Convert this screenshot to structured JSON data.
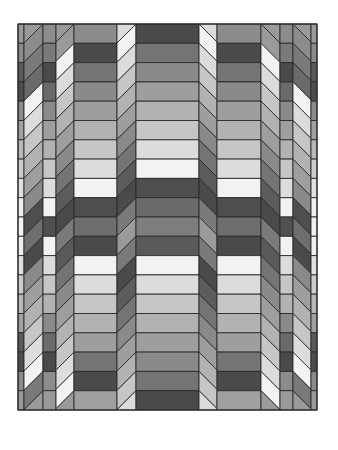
{
  "image": {
    "subject": "Quilt pattern",
    "description": "Grayscale pieced quilt with horizontal bands and slanted folded columns creating a 3D ribbon illusion"
  },
  "quilt": {
    "bounds": {
      "x": 18,
      "y": 24,
      "width": 299,
      "height": 386
    },
    "rows": 20,
    "border_color": "#2a2a2a",
    "palette": [
      "#4a4a4a",
      "#5c5c5c",
      "#747474",
      "#8a8a8a",
      "#9e9e9e",
      "#b2b2b2",
      "#c6c6c6",
      "#dcdcdc",
      "#f2f2f2"
    ],
    "columns": [
      {
        "name": "edge-left",
        "x0": 18,
        "x1": 24,
        "type": "flat",
        "colors": [
          "#9a9a9a",
          "#8a8a8a",
          "#5a5a5a",
          "#4e4e4e",
          "#8a8a8a",
          "#a0a0a0",
          "#b8b8b8",
          "#cccccc",
          "#e0e0e0",
          "#f0f0f0",
          "#f2f2f2",
          "#f0f0f0",
          "#e0e0e0",
          "#cccccc",
          "#b8b8b8",
          "#a0a0a0",
          "#5a5a5a",
          "#4e4e4e",
          "#8a8a8a",
          "#9a9a9a"
        ]
      },
      {
        "name": "slant-left-outer",
        "x0": 24,
        "x1": 43,
        "type": "slant",
        "dir": "down",
        "start": 2,
        "colors": [
          "#8c8c8c",
          "#7a7a7a",
          "#6a6a6a",
          "#f2f2f2",
          "#dcdcdc",
          "#c6c6c6",
          "#b2b2b2",
          "#9e9e9e",
          "#8a8a8a",
          "#4e4e4e",
          "#6e6e6e",
          "#4a4a4a",
          "#8a8a8a",
          "#9e9e9e",
          "#b2b2b2",
          "#c6c6c6",
          "#dcdcdc",
          "#f2f2f2",
          "#7a7a7a",
          "#9a9a9a"
        ]
      },
      {
        "name": "strip-left",
        "x0": 43,
        "x1": 56,
        "type": "flat",
        "colors": [
          "#8c8c8c",
          "#7a7a7a",
          "#4a4a4a",
          "#6a6a6a",
          "#8a8a8a",
          "#9e9e9e",
          "#b2b2b2",
          "#c6c6c6",
          "#dcdcdc",
          "#f2f2f2",
          "#505050",
          "#f2f2f2",
          "#dcdcdc",
          "#c6c6c6",
          "#b2b2b2",
          "#8a8a8a",
          "#6a6a6a",
          "#4a4a4a",
          "#8c8c8c",
          "#9a9a9a"
        ]
      },
      {
        "name": "slant-left-inner",
        "x0": 56,
        "x1": 74,
        "type": "slant",
        "dir": "down",
        "start": 1,
        "colors": [
          "#9a9a9a",
          "#f2f2f2",
          "#dcdcdc",
          "#c6c6c6",
          "#b2b2b2",
          "#9e9e9e",
          "#8a8a8a",
          "#747474",
          "#5c5c5c",
          "#4a4a4a",
          "#7a7a7a",
          "#5a5a5a",
          "#747474",
          "#8a8a8a",
          "#9e9e9e",
          "#b2b2b2",
          "#c6c6c6",
          "#dcdcdc",
          "#f2f2f2",
          "#9a9a9a"
        ]
      },
      {
        "name": "band-left",
        "x0": 74,
        "x1": 117,
        "type": "flat",
        "colors": [
          "#8c8c8c",
          "#4a4a4a",
          "#747474",
          "#8a8a8a",
          "#9e9e9e",
          "#b2b2b2",
          "#c6c6c6",
          "#dcdcdc",
          "#f2f2f2",
          "#4e4e4e",
          "#6e6e6e",
          "#4a4a4a",
          "#f2f2f2",
          "#dcdcdc",
          "#c6c6c6",
          "#b2b2b2",
          "#9e9e9e",
          "#747474",
          "#4a4a4a",
          "#a0a0a0"
        ]
      },
      {
        "name": "slant-center-left",
        "x0": 117,
        "x1": 136,
        "type": "slant",
        "dir": "down",
        "start": 0,
        "colors": [
          "#f2f2f2",
          "#dcdcdc",
          "#c6c6c6",
          "#b2b2b2",
          "#9e9e9e",
          "#8a8a8a",
          "#747474",
          "#5c5c5c",
          "#4a4a4a",
          "#7a7a7a",
          "#9a9a9a",
          "#7a7a7a",
          "#4a4a4a",
          "#5c5c5c",
          "#747474",
          "#8a8a8a",
          "#9e9e9e",
          "#b2b2b2",
          "#c6c6c6",
          "#dcdcdc"
        ]
      },
      {
        "name": "band-center",
        "x0": 136,
        "x1": 199,
        "type": "flat",
        "colors": [
          "#4a4a4a",
          "#747474",
          "#8a8a8a",
          "#9e9e9e",
          "#b2b2b2",
          "#c6c6c6",
          "#dcdcdc",
          "#f2f2f2",
          "#4e4e4e",
          "#6a6a6a",
          "#7e7e7e",
          "#5a5a5a",
          "#f2f2f2",
          "#dcdcdc",
          "#c6c6c6",
          "#b2b2b2",
          "#9e9e9e",
          "#8a8a8a",
          "#747474",
          "#4a4a4a"
        ]
      },
      {
        "name": "slant-center-right",
        "x0": 199,
        "x1": 217,
        "type": "slant",
        "dir": "up",
        "start": 0,
        "colors": [
          "#f2f2f2",
          "#dcdcdc",
          "#c6c6c6",
          "#b2b2b2",
          "#9e9e9e",
          "#8a8a8a",
          "#747474",
          "#5c5c5c",
          "#4a4a4a",
          "#7a7a7a",
          "#9a9a9a",
          "#7a7a7a",
          "#4a4a4a",
          "#5c5c5c",
          "#747474",
          "#8a8a8a",
          "#9e9e9e",
          "#b2b2b2",
          "#c6c6c6",
          "#dcdcdc"
        ]
      },
      {
        "name": "band-right",
        "x0": 217,
        "x1": 261,
        "type": "flat",
        "colors": [
          "#8c8c8c",
          "#4a4a4a",
          "#747474",
          "#8a8a8a",
          "#9e9e9e",
          "#b2b2b2",
          "#c6c6c6",
          "#dcdcdc",
          "#f2f2f2",
          "#4e4e4e",
          "#6e6e6e",
          "#4a4a4a",
          "#f2f2f2",
          "#dcdcdc",
          "#c6c6c6",
          "#b2b2b2",
          "#9e9e9e",
          "#747474",
          "#4a4a4a",
          "#a0a0a0"
        ]
      },
      {
        "name": "slant-right-inner",
        "x0": 261,
        "x1": 280,
        "type": "slant",
        "dir": "up",
        "start": 1,
        "colors": [
          "#9a9a9a",
          "#f2f2f2",
          "#dcdcdc",
          "#c6c6c6",
          "#b2b2b2",
          "#9e9e9e",
          "#8a8a8a",
          "#747474",
          "#5c5c5c",
          "#4a4a4a",
          "#7a7a7a",
          "#5a5a5a",
          "#747474",
          "#8a8a8a",
          "#9e9e9e",
          "#b2b2b2",
          "#c6c6c6",
          "#dcdcdc",
          "#f2f2f2",
          "#9a9a9a"
        ]
      },
      {
        "name": "strip-right",
        "x0": 280,
        "x1": 293,
        "type": "flat",
        "colors": [
          "#8c8c8c",
          "#7a7a7a",
          "#4a4a4a",
          "#6a6a6a",
          "#8a8a8a",
          "#9e9e9e",
          "#b2b2b2",
          "#c6c6c6",
          "#dcdcdc",
          "#f2f2f2",
          "#505050",
          "#f2f2f2",
          "#dcdcdc",
          "#c6c6c6",
          "#b2b2b2",
          "#8a8a8a",
          "#6a6a6a",
          "#4a4a4a",
          "#8c8c8c",
          "#9a9a9a"
        ]
      },
      {
        "name": "slant-right-outer",
        "x0": 293,
        "x1": 311,
        "type": "slant",
        "dir": "up",
        "start": 2,
        "colors": [
          "#8c8c8c",
          "#7a7a7a",
          "#6a6a6a",
          "#f2f2f2",
          "#dcdcdc",
          "#c6c6c6",
          "#b2b2b2",
          "#9e9e9e",
          "#8a8a8a",
          "#4e4e4e",
          "#6e6e6e",
          "#4a4a4a",
          "#8a8a8a",
          "#9e9e9e",
          "#b2b2b2",
          "#c6c6c6",
          "#dcdcdc",
          "#f2f2f2",
          "#7a7a7a",
          "#9a9a9a"
        ]
      },
      {
        "name": "edge-right",
        "x0": 311,
        "x1": 317,
        "type": "flat",
        "colors": [
          "#9a9a9a",
          "#8a8a8a",
          "#5a5a5a",
          "#4e4e4e",
          "#8a8a8a",
          "#a0a0a0",
          "#b8b8b8",
          "#cccccc",
          "#e0e0e0",
          "#f0f0f0",
          "#f2f2f2",
          "#f0f0f0",
          "#e0e0e0",
          "#cccccc",
          "#b8b8b8",
          "#a0a0a0",
          "#5a5a5a",
          "#4e4e4e",
          "#8a8a8a",
          "#9a9a9a"
        ]
      }
    ]
  }
}
